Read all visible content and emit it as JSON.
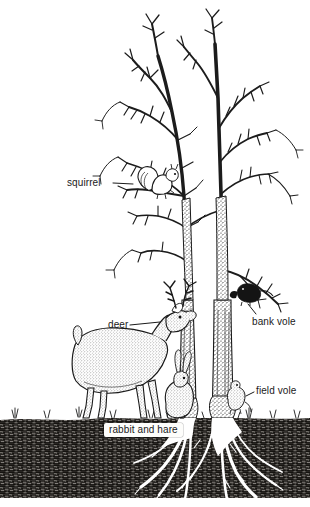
{
  "illustration": {
    "title": "Woodland tree browsing and grazing mammals",
    "style": "pen-and-ink stipple line drawing, black on white",
    "background_color": "#ffffff",
    "ink_color": "#1a1a1a",
    "soil_color": "#2e2c28",
    "root_color": "#ffffff"
  },
  "labels": [
    {
      "id": "squirrel",
      "text": "squirrel",
      "boxed": false
    },
    {
      "id": "deer",
      "text": "deer",
      "boxed": false
    },
    {
      "id": "bank_vole",
      "text": "bank vole",
      "boxed": false
    },
    {
      "id": "field_vole",
      "text": "field vole",
      "boxed": false
    },
    {
      "id": "rabbit",
      "text": "rabbit and hare",
      "boxed": true
    }
  ],
  "scene_elements": {
    "tree": "bare deciduous tree with two main trunks and fine winter branches",
    "ground_band": "dark stippled soil cross-section with grass tufts at surface",
    "roots": "white radiating root system below the trunk bases",
    "animals": [
      "squirrel",
      "deer",
      "bank vole",
      "field vole",
      "rabbit and hare"
    ]
  },
  "geometry": {
    "width": 310,
    "height": 507,
    "ground_top_y": 418,
    "ground_bottom_y": 498
  }
}
